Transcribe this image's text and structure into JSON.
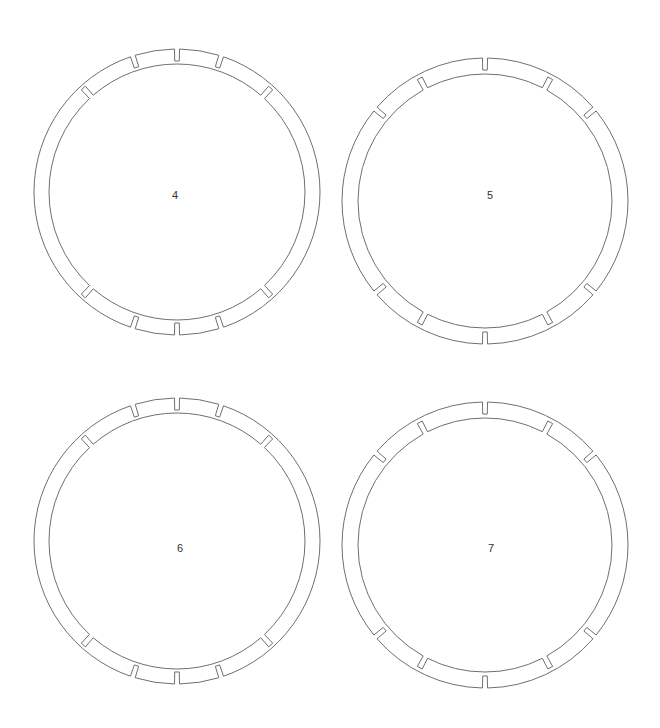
{
  "diagram": {
    "stroke_color": "#6f6f6f",
    "label_color": "#333333",
    "background": "#ffffff",
    "notch": {
      "width_px": 5,
      "depth_px": 12
    },
    "rings": [
      {
        "label": "4",
        "cx": 177,
        "cy": 192,
        "outer_r": 143,
        "inner_r": 128,
        "label_pos": [
          175,
          196
        ],
        "outer_notches_deg": [
          -18,
          0,
          18,
          162,
          180,
          198
        ],
        "inner_notches_deg": [
          -42,
          42,
          138,
          222
        ]
      },
      {
        "label": "5",
        "cx": 485,
        "cy": 201,
        "outer_r": 143,
        "inner_r": 127,
        "label_pos": [
          490,
          196
        ],
        "outer_notches_deg": [
          -50,
          0,
          50,
          130,
          180,
          230
        ],
        "inner_notches_deg": [
          -28,
          28,
          152,
          208
        ]
      },
      {
        "label": "6",
        "cx": 177,
        "cy": 541,
        "outer_r": 143,
        "inner_r": 128,
        "label_pos": [
          180,
          549
        ],
        "outer_notches_deg": [
          -18,
          0,
          18,
          162,
          180,
          198
        ],
        "inner_notches_deg": [
          -42,
          42,
          138,
          222
        ]
      },
      {
        "label": "7",
        "cx": 485,
        "cy": 545,
        "outer_r": 143,
        "inner_r": 127,
        "label_pos": [
          491,
          549
        ],
        "outer_notches_deg": [
          -50,
          0,
          50,
          130,
          180,
          230
        ],
        "inner_notches_deg": [
          -28,
          28,
          152,
          208
        ]
      }
    ]
  }
}
